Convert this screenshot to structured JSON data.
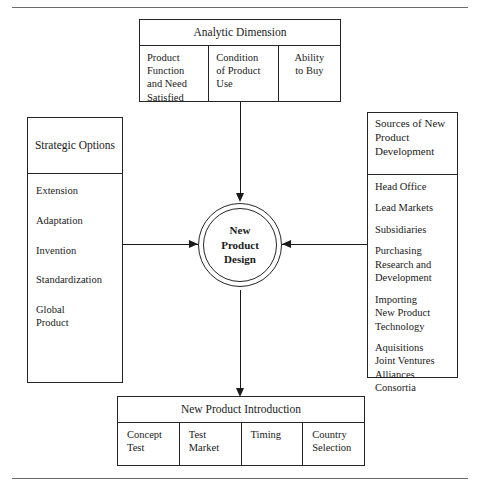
{
  "diagram": {
    "center": {
      "label": "New\nProduct\nDesign"
    },
    "top_box": {
      "header": "Analytic Dimension",
      "cells": [
        "Product\nFunction\nand Need\nSatisfied",
        "Condition\nof Product\nUse",
        "Ability\nto Buy"
      ]
    },
    "left_box": {
      "header": "Strategic\nOptions",
      "items": [
        "Extension",
        "Adaptation",
        "Invention",
        "Standardization",
        "Global\nProduct"
      ]
    },
    "right_box": {
      "header": "Sources\nof New\nProduct\nDevelopment",
      "items": [
        "Head Office",
        "Lead Markets",
        "Subsidiaries",
        "Purchasing\nResearch and\nDevelopment",
        "Importing\nNew Product\nTechnology",
        "Aquisitions\nJoint Ventures\nAlliances\nConsortia"
      ]
    },
    "bottom_box": {
      "header": "New Product Introduction",
      "cells": [
        "Concept\nTest",
        "Test\nMarket",
        "Timing",
        "Country\nSelection"
      ]
    },
    "arrows": [
      {
        "name": "top-to-center",
        "direction": "down"
      },
      {
        "name": "center-to-bottom",
        "direction": "down"
      },
      {
        "name": "left-to-center",
        "direction": "right"
      },
      {
        "name": "right-to-center",
        "direction": "left"
      }
    ],
    "colors": {
      "line": "#262626",
      "arrow": "#1a1a1a",
      "rule": "#6b6b6b",
      "background": "#ffffff"
    }
  }
}
